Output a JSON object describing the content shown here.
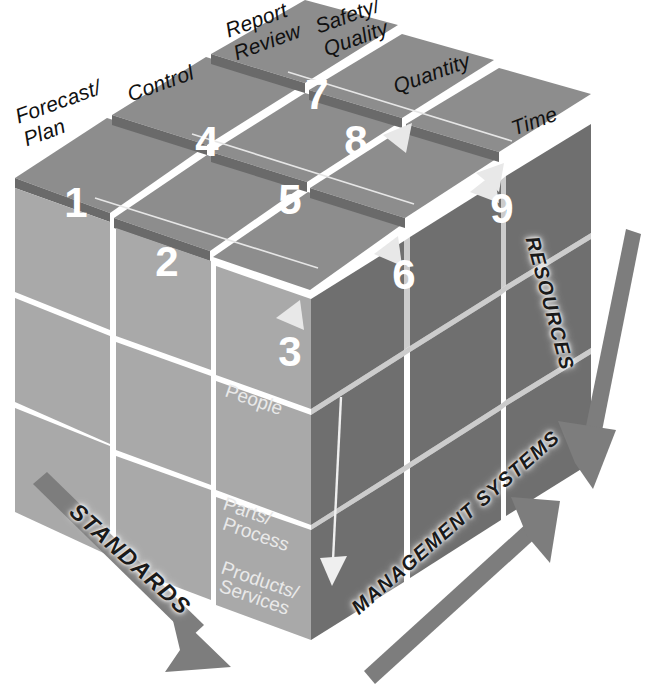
{
  "diagram": {
    "type": "3d-cube-matrix",
    "top_axis_labels": [
      "Forecast/\nPlan",
      "Control",
      "Report\nReview",
      "Safety/\nQuality",
      "Quantity",
      "Time"
    ],
    "top_face_numbers": [
      "1",
      "2",
      "3",
      "4",
      "5",
      "6",
      "7",
      "8",
      "9"
    ],
    "front_face_rows": [
      "People",
      "Parts/\nProcess",
      "Products/\nServices"
    ],
    "dimension_arrows": [
      {
        "label": "STANDARDS",
        "direction": "down-right"
      },
      {
        "label": "MANAGEMENT SYSTEMS",
        "direction": "up-right"
      },
      {
        "label": "RESOURCES",
        "direction": "down"
      }
    ],
    "colors": {
      "top_face": "#8d8d8d",
      "left_face": "#a9a9a9",
      "right_face": "#6f6f6f",
      "gap": "#5a5a5a",
      "arrow_gray": "#7d7d7d",
      "number_white": "#ffffff",
      "text_black": "#111111",
      "background": "#ffffff"
    }
  }
}
